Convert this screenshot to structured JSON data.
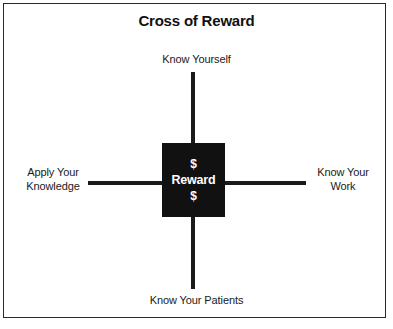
{
  "figure": {
    "title": "Cross of Reward",
    "background_color": "#ffffff",
    "frame_color": "#2b2b2b",
    "cross_color": "#1a1a1a",
    "center_box_color": "#111111",
    "center_text_color": "#ffffff"
  },
  "center": {
    "money_top": "$",
    "label": "Reward",
    "money_bottom": "$"
  },
  "arms": {
    "top": {
      "label": "Know Yourself"
    },
    "bottom": {
      "label": "Know Your Patients"
    },
    "left": {
      "line1": "Apply Your",
      "line2": "Knowledge"
    },
    "right": {
      "line1": "Know Your",
      "line2": "Work"
    }
  },
  "chart_data": {
    "type": "diagram",
    "title": "Cross of Reward",
    "center_node": "$ Reward $",
    "nodes": [
      {
        "position": "top",
        "label": "Know Yourself"
      },
      {
        "position": "right",
        "label": "Know Your Work"
      },
      {
        "position": "bottom",
        "label": "Know Your Patients"
      },
      {
        "position": "left",
        "label": "Apply Your Knowledge"
      }
    ]
  }
}
